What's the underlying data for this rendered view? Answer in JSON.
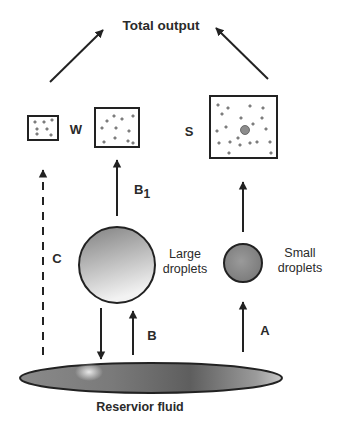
{
  "title": "Total output",
  "labels": {
    "w": "W",
    "s": "S",
    "c": "C",
    "b1_main": "B",
    "b1_sub": "1",
    "b": "B",
    "a": "A",
    "large_line1": "Large",
    "large_line2": "droplets",
    "small_line1": "Small",
    "small_line2": "droplets",
    "reservoir": "Reservior fluid"
  },
  "colors": {
    "stroke": "#222222",
    "text": "#2a2a2a",
    "droplet_large_top": "#8a8a8a",
    "droplet_large_bottom": "#f0f0f0",
    "droplet_small": "#8c8c8c",
    "dot": "#8a8a8a"
  }
}
